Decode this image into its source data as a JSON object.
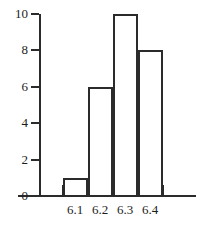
{
  "chart_data": {
    "type": "bar",
    "title": "",
    "subtitle": "",
    "xlabel": "",
    "ylabel": "",
    "categories": [
      "6.1",
      "6.2",
      "6.3",
      "6.4"
    ],
    "values": [
      1,
      6,
      10,
      8
    ],
    "series": [
      {
        "name": "frequency",
        "values": [
          1,
          6,
          10,
          8
        ]
      }
    ],
    "ylim": [
      0,
      10
    ],
    "y_ticks": [
      0,
      2,
      4,
      6,
      8,
      10
    ],
    "y_tick_labels": [
      "0",
      "2",
      "4",
      "6",
      "8",
      "10"
    ],
    "x_tick_labels": [
      "6.1",
      "6.2",
      "6.3",
      "6.4"
    ],
    "grid": false,
    "legend": null,
    "legend_position": "none",
    "annotations": [],
    "style": {
      "bar_fill": "none",
      "bar_outline": "#2b2b2b",
      "axis_color": "#2b2b2b",
      "text_color": "#1d1d1d",
      "background": "#ffffff"
    }
  }
}
